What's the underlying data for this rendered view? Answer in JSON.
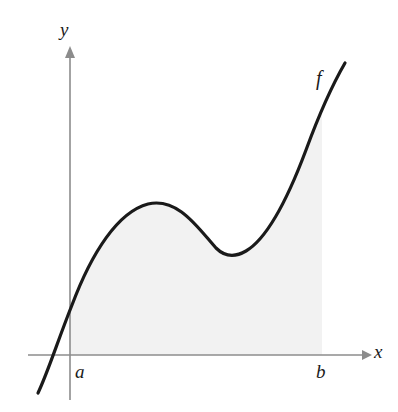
{
  "figure": {
    "kind": "math-diagram",
    "width": 398,
    "height": 412,
    "background_color": "#ffffff"
  },
  "axes": {
    "x_axis": {
      "label": "x",
      "color": "#8c8c8c",
      "y_pixel": 355,
      "x_start_pixel": 28,
      "x_end_pixel": 368,
      "arrow": "right"
    },
    "y_axis": {
      "label": "y",
      "color": "#8c8c8c",
      "x_pixel": 70,
      "y_top_pixel": 48,
      "y_bottom_pixel": 400,
      "arrow": "up"
    }
  },
  "labels": {
    "y_axis_label": "y",
    "x_axis_label": "x",
    "lower_bound": "a",
    "upper_bound": "b",
    "function_label": "f"
  },
  "curve": {
    "name": "f",
    "color": "#1a1a1a",
    "stroke_width": 3.2,
    "shape": "cubic with a local maximum then a local minimum",
    "path": "M 38 393 C 48 372, 58 340, 72 305 C 92 252, 118 212, 148 204 C 178 197, 198 228, 216 248 C 224 256, 234 258, 246 251 C 268 238, 288 198, 306 150 C 320 112, 334 82, 345 63"
  },
  "shaded_region": {
    "name": "area-under-curve",
    "fill_color": "#f2f2f2",
    "from_label": "a",
    "to_label": "b",
    "from_x_pixel": 70,
    "to_x_pixel": 322,
    "baseline_y_pixel": 355,
    "path": "M 70 355 L 70 308 C 92 252, 118 212, 148 204 C 178 197, 198 228, 216 248 C 224 256, 234 258, 246 251 C 268 238, 288 198, 306 150 C 312 134, 318 120, 322 110 L 322 355 Z"
  },
  "chart_data": {
    "type": "line",
    "title": "",
    "xlabel": "x",
    "ylabel": "y",
    "grid": false,
    "legend": null,
    "annotations": [
      {
        "text": "f",
        "x_pixel": 322,
        "y_pixel": 80,
        "role": "curve-label"
      },
      {
        "text": "a",
        "x_pixel": 78,
        "y_pixel": 372,
        "role": "x-bound-label"
      },
      {
        "text": "b",
        "x_pixel": 320,
        "y_pixel": 372,
        "role": "x-bound-label"
      }
    ],
    "series": [
      {
        "name": "f",
        "points_pixels": [
          [
            38,
            393
          ],
          [
            52,
            368
          ],
          [
            62,
            355
          ],
          [
            72,
            305
          ],
          [
            90,
            256
          ],
          [
            110,
            226
          ],
          [
            128,
            210
          ],
          [
            148,
            203
          ],
          [
            168,
            206
          ],
          [
            188,
            222
          ],
          [
            208,
            243
          ],
          [
            228,
            254
          ],
          [
            248,
            250
          ],
          [
            268,
            236
          ],
          [
            288,
            204
          ],
          [
            306,
            150
          ],
          [
            324,
            108
          ],
          [
            345,
            63
          ]
        ]
      }
    ]
  }
}
